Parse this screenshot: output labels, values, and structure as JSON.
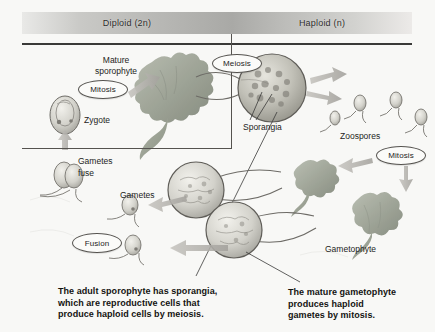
{
  "figure": {
    "type": "life-cycle-diagram",
    "background_color": "#f8f8f6"
  },
  "header": {
    "bands": [
      {
        "label": "Diploid (2n)",
        "side": "left"
      },
      {
        "label": "Haploid (n)",
        "side": "right"
      }
    ]
  },
  "labels": {
    "mature_sporophyte_line1": "Mature",
    "mature_sporophyte_line2": "sporophyte",
    "zygote": "Zygote",
    "sporangia": "Sporangia",
    "zoospores": "Zoospores",
    "gametes_fuse_line1": "Gametes",
    "gametes_fuse_line2": "fuse",
    "gametes": "Gametes",
    "gametophyte": "Gametophyte"
  },
  "stages": [
    {
      "id": "mitosis-left",
      "label": "Mitosis"
    },
    {
      "id": "meiosis",
      "label": "Meiosis"
    },
    {
      "id": "mitosis-right",
      "label": "Mitosis"
    },
    {
      "id": "fusion",
      "label": "Fusion"
    }
  ],
  "captions": {
    "left": {
      "line1": "The adult sporophyte has sporangia,",
      "line2": "which are reproductive cells that",
      "line3": "produce haploid cells by meiosis."
    },
    "right": {
      "line1": "The mature gametophyte",
      "line2": "produces haploid",
      "line3": "gametes by mitosis."
    }
  },
  "colors": {
    "band_dark": "#a9a9a6",
    "band_light": "#eceae8",
    "rule": "#3a3a38",
    "text": "#1d1d1b",
    "alga": "#9a9f93",
    "alga_dark": "#7b8174",
    "cell_outline": "#6d6b66",
    "arrow": "#b5b3ae"
  }
}
